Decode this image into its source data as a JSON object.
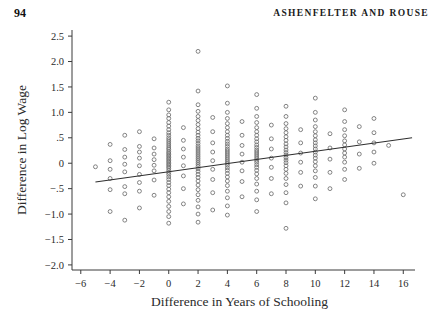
{
  "running_head": {
    "folio": "94",
    "authors": "ASHENFELTER AND ROUSE"
  },
  "chart_data": {
    "type": "scatter",
    "title": "",
    "xlabel": "Difference in Years of Schooling",
    "ylabel": "Difference in Log Wage",
    "xlim": [
      -6.6,
      16.8
    ],
    "ylim": [
      -2.1,
      2.62
    ],
    "grid": false,
    "legend": null,
    "xticks": [
      -6,
      -4,
      -2,
      0,
      2,
      4,
      6,
      8,
      10,
      12,
      14,
      16
    ],
    "xticklabels": [
      "−6",
      "−4",
      "−2",
      "0",
      "2",
      "4",
      "6",
      "8",
      "10",
      "12",
      "14",
      "16"
    ],
    "yticks": [
      2.5,
      2.0,
      1.5,
      1.0,
      0.5,
      0,
      -0.5,
      -1.0,
      -1.5,
      -2.0
    ],
    "yticklabels": [
      "2.5",
      "2.0",
      "1.5",
      "1.0",
      ".5",
      "0",
      "−.5",
      "−1.0",
      "−1.5",
      "−2.0"
    ],
    "marker": "open-circle",
    "marker_size": 3.0,
    "marker_color": "#6e6e6e",
    "fit_line": {
      "name": "regression-line",
      "x0": -5.0,
      "y0": -0.37,
      "x1": 16.6,
      "y1": 0.5,
      "slope": 0.0403,
      "intercept": -0.169,
      "color": "#2e2e2e"
    },
    "series": [
      {
        "name": "twin pairs",
        "points": [
          [
            -5,
            -0.07
          ],
          [
            -4,
            0.37
          ],
          [
            -4,
            0.05
          ],
          [
            -4,
            -0.12
          ],
          [
            -4,
            -0.3
          ],
          [
            -4,
            -0.52
          ],
          [
            -4,
            -0.95
          ],
          [
            -3,
            0.55
          ],
          [
            -3,
            0.27
          ],
          [
            -3,
            0.12
          ],
          [
            -3,
            -0.02
          ],
          [
            -3,
            -0.17
          ],
          [
            -3,
            -0.46
          ],
          [
            -3,
            -0.6
          ],
          [
            -3,
            -1.12
          ],
          [
            -2,
            0.62
          ],
          [
            -2,
            0.33
          ],
          [
            -2,
            0.22
          ],
          [
            -2,
            0.1
          ],
          [
            -2,
            -0.05
          ],
          [
            -2,
            -0.22
          ],
          [
            -2,
            -0.38
          ],
          [
            -2,
            -0.55
          ],
          [
            -2,
            -0.88
          ],
          [
            -1,
            0.48
          ],
          [
            -1,
            0.3
          ],
          [
            -1,
            0.18
          ],
          [
            -1,
            0.07
          ],
          [
            -1,
            -0.04
          ],
          [
            -1,
            -0.15
          ],
          [
            -1,
            -0.33
          ],
          [
            -1,
            -0.63
          ],
          [
            0,
            1.2
          ],
          [
            0,
            1.05
          ],
          [
            0,
            0.95
          ],
          [
            0,
            0.88
          ],
          [
            0,
            0.8
          ],
          [
            0,
            0.73
          ],
          [
            0,
            0.66
          ],
          [
            0,
            0.6
          ],
          [
            0,
            0.55
          ],
          [
            0,
            0.5
          ],
          [
            0,
            0.46
          ],
          [
            0,
            0.42
          ],
          [
            0,
            0.38
          ],
          [
            0,
            0.34
          ],
          [
            0,
            0.3
          ],
          [
            0,
            0.27
          ],
          [
            0,
            0.23
          ],
          [
            0,
            0.2
          ],
          [
            0,
            0.17
          ],
          [
            0,
            0.14
          ],
          [
            0,
            0.11
          ],
          [
            0,
            0.08
          ],
          [
            0,
            0.05
          ],
          [
            0,
            0.02
          ],
          [
            0,
            -0.01
          ],
          [
            0,
            -0.04
          ],
          [
            0,
            -0.07
          ],
          [
            0,
            -0.1
          ],
          [
            0,
            -0.14
          ],
          [
            0,
            -0.18
          ],
          [
            0,
            -0.22
          ],
          [
            0,
            -0.27
          ],
          [
            0,
            -0.32
          ],
          [
            0,
            -0.38
          ],
          [
            0,
            -0.44
          ],
          [
            0,
            -0.51
          ],
          [
            0,
            -0.58
          ],
          [
            0,
            -0.66
          ],
          [
            0,
            -0.75
          ],
          [
            0,
            -0.85
          ],
          [
            0,
            -0.95
          ],
          [
            0,
            -1.05
          ],
          [
            0,
            -1.18
          ],
          [
            1,
            0.7
          ],
          [
            1,
            0.45
          ],
          [
            1,
            0.28
          ],
          [
            1,
            0.12
          ],
          [
            1,
            -0.05
          ],
          [
            1,
            -0.25
          ],
          [
            1,
            -0.5
          ],
          [
            1,
            -0.8
          ],
          [
            2,
            2.2
          ],
          [
            2,
            1.42
          ],
          [
            2,
            1.15
          ],
          [
            2,
            1.02
          ],
          [
            2,
            0.92
          ],
          [
            2,
            0.84
          ],
          [
            2,
            0.76
          ],
          [
            2,
            0.68
          ],
          [
            2,
            0.61
          ],
          [
            2,
            0.55
          ],
          [
            2,
            0.49
          ],
          [
            2,
            0.44
          ],
          [
            2,
            0.39
          ],
          [
            2,
            0.34
          ],
          [
            2,
            0.3
          ],
          [
            2,
            0.26
          ],
          [
            2,
            0.22
          ],
          [
            2,
            0.18
          ],
          [
            2,
            0.14
          ],
          [
            2,
            0.1
          ],
          [
            2,
            0.06
          ],
          [
            2,
            0.02
          ],
          [
            2,
            -0.02
          ],
          [
            2,
            -0.06
          ],
          [
            2,
            -0.11
          ],
          [
            2,
            -0.16
          ],
          [
            2,
            -0.22
          ],
          [
            2,
            -0.28
          ],
          [
            2,
            -0.35
          ],
          [
            2,
            -0.43
          ],
          [
            2,
            -0.52
          ],
          [
            2,
            -0.62
          ],
          [
            2,
            -0.73
          ],
          [
            2,
            -0.86
          ],
          [
            2,
            -1.0
          ],
          [
            2,
            -1.16
          ],
          [
            3,
            0.9
          ],
          [
            3,
            0.62
          ],
          [
            3,
            0.4
          ],
          [
            3,
            0.22
          ],
          [
            3,
            0.05
          ],
          [
            3,
            -0.12
          ],
          [
            3,
            -0.32
          ],
          [
            3,
            -0.58
          ],
          [
            3,
            -0.92
          ],
          [
            4,
            1.52
          ],
          [
            4,
            1.18
          ],
          [
            4,
            1.0
          ],
          [
            4,
            0.88
          ],
          [
            4,
            0.78
          ],
          [
            4,
            0.7
          ],
          [
            4,
            0.62
          ],
          [
            4,
            0.55
          ],
          [
            4,
            0.49
          ],
          [
            4,
            0.43
          ],
          [
            4,
            0.38
          ],
          [
            4,
            0.33
          ],
          [
            4,
            0.28
          ],
          [
            4,
            0.24
          ],
          [
            4,
            0.2
          ],
          [
            4,
            0.16
          ],
          [
            4,
            0.12
          ],
          [
            4,
            0.08
          ],
          [
            4,
            0.04
          ],
          [
            4,
            0.0
          ],
          [
            4,
            -0.04
          ],
          [
            4,
            -0.09
          ],
          [
            4,
            -0.14
          ],
          [
            4,
            -0.2
          ],
          [
            4,
            -0.27
          ],
          [
            4,
            -0.35
          ],
          [
            4,
            -0.44
          ],
          [
            4,
            -0.55
          ],
          [
            4,
            -0.68
          ],
          [
            4,
            -0.84
          ],
          [
            4,
            -1.02
          ],
          [
            5,
            0.82
          ],
          [
            5,
            0.55
          ],
          [
            5,
            0.35
          ],
          [
            5,
            0.18
          ],
          [
            5,
            0.02
          ],
          [
            5,
            -0.15
          ],
          [
            5,
            -0.36
          ],
          [
            5,
            -0.66
          ],
          [
            6,
            1.35
          ],
          [
            6,
            1.08
          ],
          [
            6,
            0.92
          ],
          [
            6,
            0.8
          ],
          [
            6,
            0.7
          ],
          [
            6,
            0.62
          ],
          [
            6,
            0.55
          ],
          [
            6,
            0.48
          ],
          [
            6,
            0.42
          ],
          [
            6,
            0.36
          ],
          [
            6,
            0.31
          ],
          [
            6,
            0.26
          ],
          [
            6,
            0.22
          ],
          [
            6,
            0.18
          ],
          [
            6,
            0.14
          ],
          [
            6,
            0.1
          ],
          [
            6,
            0.06
          ],
          [
            6,
            0.02
          ],
          [
            6,
            -0.03
          ],
          [
            6,
            -0.08
          ],
          [
            6,
            -0.14
          ],
          [
            6,
            -0.21
          ],
          [
            6,
            -0.3
          ],
          [
            6,
            -0.41
          ],
          [
            6,
            -0.55
          ],
          [
            6,
            -0.72
          ],
          [
            6,
            -0.95
          ],
          [
            7,
            0.75
          ],
          [
            7,
            0.48
          ],
          [
            7,
            0.28
          ],
          [
            7,
            0.1
          ],
          [
            7,
            -0.08
          ],
          [
            7,
            -0.3
          ],
          [
            7,
            -0.6
          ],
          [
            8,
            1.12
          ],
          [
            8,
            0.92
          ],
          [
            8,
            0.78
          ],
          [
            8,
            0.68
          ],
          [
            8,
            0.6
          ],
          [
            8,
            0.52
          ],
          [
            8,
            0.45
          ],
          [
            8,
            0.38
          ],
          [
            8,
            0.32
          ],
          [
            8,
            0.26
          ],
          [
            8,
            0.21
          ],
          [
            8,
            0.16
          ],
          [
            8,
            0.11
          ],
          [
            8,
            0.06
          ],
          [
            8,
            0.01
          ],
          [
            8,
            -0.05
          ],
          [
            8,
            -0.12
          ],
          [
            8,
            -0.2
          ],
          [
            8,
            -0.3
          ],
          [
            8,
            -0.42
          ],
          [
            8,
            -0.58
          ],
          [
            8,
            -0.78
          ],
          [
            8,
            -1.28
          ],
          [
            9,
            0.66
          ],
          [
            9,
            0.4
          ],
          [
            9,
            0.2
          ],
          [
            9,
            0.02
          ],
          [
            9,
            -0.18
          ],
          [
            9,
            -0.45
          ],
          [
            10,
            1.28
          ],
          [
            10,
            1.0
          ],
          [
            10,
            0.85
          ],
          [
            10,
            0.72
          ],
          [
            10,
            0.62
          ],
          [
            10,
            0.54
          ],
          [
            10,
            0.46
          ],
          [
            10,
            0.4
          ],
          [
            10,
            0.34
          ],
          [
            10,
            0.28
          ],
          [
            10,
            0.22
          ],
          [
            10,
            0.16
          ],
          [
            10,
            0.1
          ],
          [
            10,
            0.03
          ],
          [
            10,
            -0.05
          ],
          [
            10,
            -0.15
          ],
          [
            10,
            -0.28
          ],
          [
            10,
            -0.45
          ],
          [
            10,
            -0.7
          ],
          [
            11,
            0.58
          ],
          [
            11,
            0.3
          ],
          [
            11,
            0.08
          ],
          [
            11,
            -0.18
          ],
          [
            11,
            -0.5
          ],
          [
            12,
            1.05
          ],
          [
            12,
            0.82
          ],
          [
            12,
            0.66
          ],
          [
            12,
            0.54
          ],
          [
            12,
            0.44
          ],
          [
            12,
            0.36
          ],
          [
            12,
            0.28
          ],
          [
            12,
            0.2
          ],
          [
            12,
            0.12
          ],
          [
            12,
            0.02
          ],
          [
            12,
            -0.12
          ],
          [
            12,
            -0.32
          ],
          [
            13,
            0.72
          ],
          [
            13,
            0.42
          ],
          [
            13,
            0.18
          ],
          [
            13,
            -0.1
          ],
          [
            14,
            0.88
          ],
          [
            14,
            0.6
          ],
          [
            14,
            0.4
          ],
          [
            14,
            0.22
          ],
          [
            14,
            0.0
          ],
          [
            15,
            0.35
          ],
          [
            16,
            -0.62
          ]
        ]
      }
    ]
  }
}
